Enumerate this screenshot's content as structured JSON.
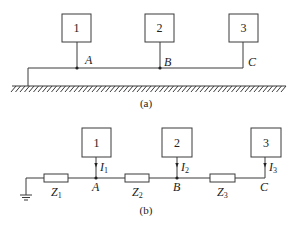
{
  "figure_a": {
    "caption": "(a)",
    "boxes": [
      {
        "label": "1",
        "x": 62,
        "y": 14,
        "w": 29,
        "h": 28,
        "wire_x": 77
      },
      {
        "label": "2",
        "x": 145,
        "y": 14,
        "w": 29,
        "h": 28,
        "wire_x": 160
      },
      {
        "label": "3",
        "x": 229,
        "y": 14,
        "w": 29,
        "h": 28,
        "wire_x": 243
      }
    ],
    "nodes": [
      {
        "label": "A",
        "x": 77,
        "y": 68,
        "dot": true
      },
      {
        "label": "B",
        "x": 160,
        "y": 68,
        "dot": true
      },
      {
        "label": "C",
        "x": 243,
        "y": 68,
        "dot": false
      }
    ],
    "bus_y": 68,
    "bus_x_start": 28,
    "ground_y": 86,
    "ground_x_start": 12,
    "ground_x_end": 286
  },
  "figure_b": {
    "caption": "(b)",
    "boxes": [
      {
        "label": "1",
        "x": 82,
        "y": 128,
        "w": 29,
        "h": 29,
        "wire_x": 96
      },
      {
        "label": "2",
        "x": 162,
        "y": 128,
        "w": 30,
        "h": 29,
        "wire_x": 177
      },
      {
        "label": "3",
        "x": 251,
        "y": 128,
        "w": 30,
        "h": 29,
        "wire_x": 265
      }
    ],
    "currents": [
      {
        "symbol": "I",
        "sub": "1"
      },
      {
        "symbol": "I",
        "sub": "2"
      },
      {
        "symbol": "I",
        "sub": "3"
      }
    ],
    "nodes": [
      {
        "label": "A",
        "dot": true
      },
      {
        "label": "B",
        "dot": true
      },
      {
        "label": "C",
        "dot": false
      }
    ],
    "impedances": [
      {
        "symbol": "Z",
        "sub": "1",
        "x": 44,
        "w": 24
      },
      {
        "symbol": "Z",
        "sub": "2",
        "x": 125,
        "w": 24
      },
      {
        "symbol": "Z",
        "sub": "3",
        "x": 210,
        "w": 25
      }
    ],
    "wire_y": 178,
    "ground_x": 26
  }
}
